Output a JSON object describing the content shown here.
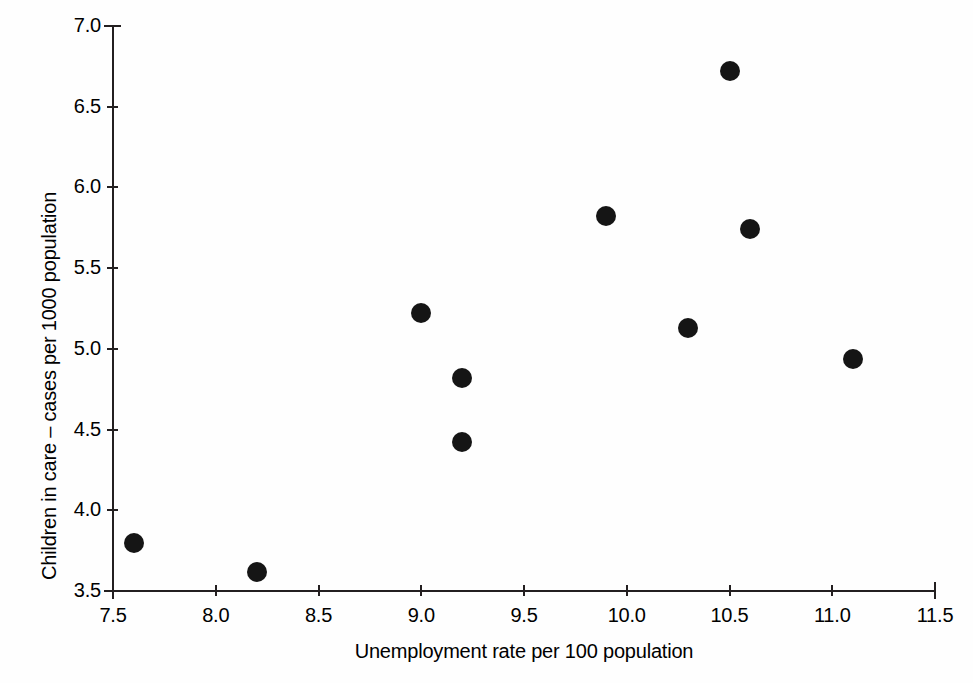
{
  "chart_data": {
    "type": "scatter",
    "title": "",
    "xlabel": "Unemployment rate per 100 population",
    "ylabel": "Children in care – cases per 1000 population",
    "xlim": [
      7.5,
      11.5
    ],
    "ylim": [
      3.5,
      7.0
    ],
    "xticks": [
      "7.5",
      "8.0",
      "8.5",
      "9.0",
      "9.5",
      "10.0",
      "10.5",
      "11.0",
      "11.5"
    ],
    "yticks": [
      "3.5",
      "4.0",
      "4.5",
      "5.0",
      "5.5",
      "6.0",
      "6.5",
      "7.0"
    ],
    "xtick_values": [
      7.5,
      8.0,
      8.5,
      9.0,
      9.5,
      10.0,
      10.5,
      11.0,
      11.5
    ],
    "ytick_values": [
      3.5,
      4.0,
      4.5,
      5.0,
      5.5,
      6.0,
      6.5,
      7.0
    ],
    "grid": false,
    "legend": false,
    "marker": "filled-circle",
    "marker_color": "#151515",
    "axis_color": "#231f20",
    "background": "#ffffff",
    "points": [
      {
        "x": 7.6,
        "y": 3.8
      },
      {
        "x": 8.2,
        "y": 3.62
      },
      {
        "x": 9.0,
        "y": 5.22
      },
      {
        "x": 9.2,
        "y": 4.82
      },
      {
        "x": 9.2,
        "y": 4.42
      },
      {
        "x": 9.9,
        "y": 5.82
      },
      {
        "x": 10.3,
        "y": 5.13
      },
      {
        "x": 10.5,
        "y": 6.72
      },
      {
        "x": 10.6,
        "y": 5.74
      },
      {
        "x": 11.1,
        "y": 4.94
      }
    ]
  }
}
